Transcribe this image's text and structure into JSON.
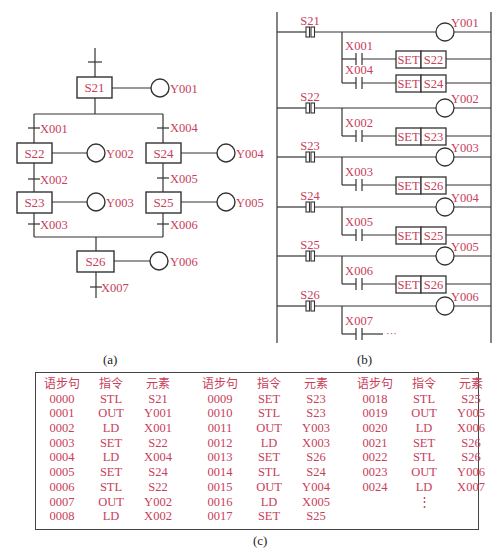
{
  "colors": {
    "label": "#c8405a",
    "line": "#333333"
  },
  "captions": {
    "a": "(a)",
    "b": "(b)",
    "c": "(c)"
  },
  "sfc": {
    "steps": [
      {
        "id": "S21",
        "output": "Y001"
      },
      {
        "id": "S22",
        "output": "Y002"
      },
      {
        "id": "S24",
        "output": "Y004"
      },
      {
        "id": "S23",
        "output": "Y003"
      },
      {
        "id": "S25",
        "output": "Y005"
      },
      {
        "id": "S26",
        "output": "Y006"
      }
    ],
    "transitions": [
      "X001",
      "X004",
      "X002",
      "X005",
      "X003",
      "X006",
      "X007"
    ]
  },
  "ladder": {
    "rungs": [
      {
        "stl": "S21",
        "out": "Y001",
        "conds": [
          {
            "contact": "X001",
            "set": "S22"
          },
          {
            "contact": "X004",
            "set": "S24"
          }
        ]
      },
      {
        "stl": "S22",
        "out": "Y002",
        "conds": [
          {
            "contact": "X002",
            "set": "S23"
          }
        ]
      },
      {
        "stl": "S23",
        "out": "Y003",
        "conds": [
          {
            "contact": "X003",
            "set": "S26"
          }
        ]
      },
      {
        "stl": "S24",
        "out": "Y004",
        "conds": [
          {
            "contact": "X005",
            "set": "S25"
          }
        ]
      },
      {
        "stl": "S25",
        "out": "Y005",
        "conds": [
          {
            "contact": "X006",
            "set": "S26"
          }
        ]
      },
      {
        "stl": "S26",
        "out": "Y006",
        "conds": [
          {
            "contact": "X007",
            "set": "..."
          }
        ]
      }
    ],
    "set_label": "SET",
    "ellipsis": "···"
  },
  "table": {
    "headers": [
      "语步句",
      "指令",
      "元素"
    ],
    "columns": [
      [
        [
          "0000",
          "STL",
          "S21"
        ],
        [
          "0001",
          "OUT",
          "Y001"
        ],
        [
          "0002",
          "LD",
          "X001"
        ],
        [
          "0003",
          "SET",
          "S22"
        ],
        [
          "0004",
          "LD",
          "X004"
        ],
        [
          "0005",
          "SET",
          "S24"
        ],
        [
          "0006",
          "STL",
          "S22"
        ],
        [
          "0007",
          "OUT",
          "Y002"
        ],
        [
          "0008",
          "LD",
          "X002"
        ]
      ],
      [
        [
          "0009",
          "SET",
          "S23"
        ],
        [
          "0010",
          "STL",
          "S23"
        ],
        [
          "0011",
          "OUT",
          "Y003"
        ],
        [
          "0012",
          "LD",
          "X003"
        ],
        [
          "0013",
          "SET",
          "S26"
        ],
        [
          "0014",
          "STL",
          "S24"
        ],
        [
          "0015",
          "OUT",
          "Y004"
        ],
        [
          "0016",
          "LD",
          "X005"
        ],
        [
          "0017",
          "SET",
          "S25"
        ]
      ],
      [
        [
          "0018",
          "STL",
          "S25"
        ],
        [
          "0019",
          "OUT",
          "Y005"
        ],
        [
          "0020",
          "LD",
          "X006"
        ],
        [
          "0021",
          "SET",
          "S26"
        ],
        [
          "0022",
          "STL",
          "S26"
        ],
        [
          "0023",
          "OUT",
          "Y006"
        ],
        [
          "0024",
          "LD",
          "X007"
        ],
        [
          "",
          "⋮",
          ""
        ]
      ]
    ]
  }
}
